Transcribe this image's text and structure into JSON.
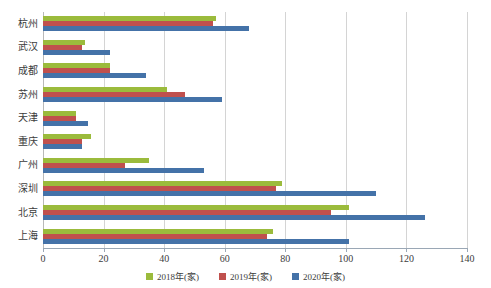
{
  "chart_data": {
    "type": "bar",
    "orientation": "horizontal",
    "title": "",
    "subtitle": "",
    "xlabel": "",
    "ylabel": "",
    "xlim": [
      0,
      140
    ],
    "xticks": [
      0,
      20,
      40,
      60,
      80,
      100,
      120,
      140
    ],
    "xtick_labels": [
      "0",
      "20",
      "40",
      "60",
      "80",
      "100",
      "120",
      "140"
    ],
    "grid": true,
    "legend_position": "bottom",
    "categories": [
      "杭州",
      "武汉",
      "成都",
      "苏州",
      "天津",
      "重庆",
      "广州",
      "深圳",
      "北京",
      "上海"
    ],
    "series": [
      {
        "name": "2018年(家)",
        "color": "#9bbb3c",
        "values": [
          57,
          14,
          22,
          41,
          11,
          16,
          35,
          79,
          101,
          76
        ]
      },
      {
        "name": "2019年(家)",
        "color": "#c0504d",
        "values": [
          56,
          13,
          22,
          47,
          11,
          13,
          27,
          77,
          95,
          74
        ]
      },
      {
        "name": "2020年(家)",
        "color": "#4472a8",
        "values": [
          68,
          22,
          34,
          59,
          15,
          13,
          53,
          110,
          126,
          101
        ]
      }
    ]
  },
  "legend": {
    "items": [
      {
        "label": "2018年(家)",
        "color": "#9bbb3c"
      },
      {
        "label": "2019年(家)",
        "color": "#c0504d"
      },
      {
        "label": "2020年(家)",
        "color": "#4472a8"
      }
    ]
  },
  "colors": {
    "series_2018": "#9bbb3c",
    "series_2019": "#c0504d",
    "series_2020": "#4472a8",
    "gridline": "#d4d4d4",
    "axis": "#9aa7b5",
    "text": "#3c3c3c",
    "background": "#ffffff"
  }
}
